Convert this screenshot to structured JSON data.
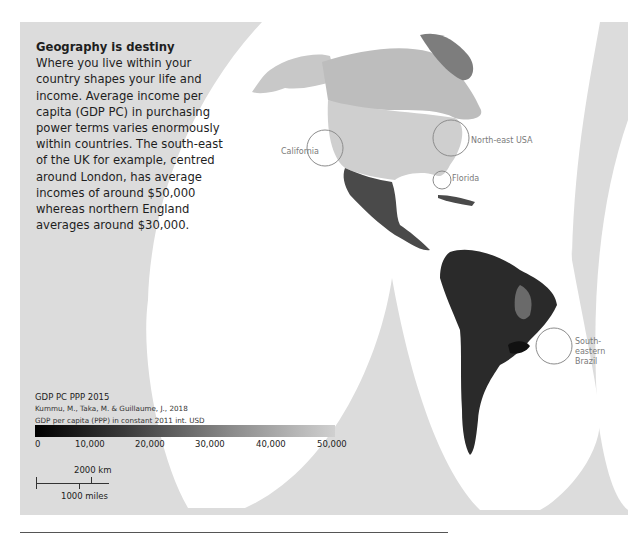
{
  "intro": {
    "title": "Geography is destiny",
    "body": "Where you live within your country shapes your life and income. Average income per capita (GDP PC) in purchasing power terms varies enormously within countries. The south-east of the UK for example, centred around London, has average incomes of around $50,000 whereas northern England averages around $30,000."
  },
  "callouts": {
    "california": "California",
    "northeast_usa": "North-east USA",
    "florida": "Florida",
    "se_brazil_line1": "South-eastern",
    "se_brazil_line2": "Brazil"
  },
  "legend": {
    "title": "GDP PC PPP 2015",
    "source": "Kummu, M., Taka, M. & Guillaume, J., 2018",
    "unit": "GDP per capita (PPP) in constant 2011 int. USD",
    "ticks": [
      "0",
      "10,000",
      "20,000",
      "30,000",
      "40,000",
      "50,000"
    ],
    "min_color": "#000000",
    "max_color": "#d0d0d0"
  },
  "scale": {
    "km": "2000 km",
    "miles": "1000 miles"
  },
  "colors": {
    "background_panel": "#dcdcdc",
    "ocean": "#ffffff",
    "callout_circle": "#8c8c8c",
    "text": "#1e1e1e"
  }
}
